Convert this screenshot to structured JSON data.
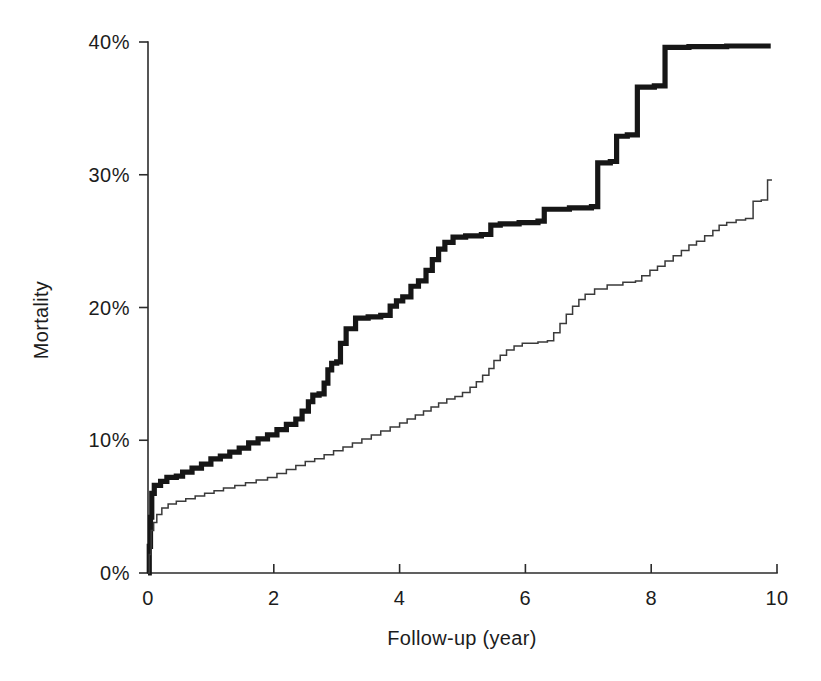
{
  "figure": {
    "background_color": "#ffffff",
    "ink_color": "#1a1a1a"
  },
  "axes": {
    "x_title": "Follow-up (year)",
    "y_title": "Mortality",
    "x_tick_labels": [
      "0",
      "2",
      "4",
      "6",
      "8",
      "10"
    ],
    "y_tick_labels": [
      "0%",
      "10%",
      "20%",
      "30%",
      "40%"
    ]
  },
  "chart_data": {
    "type": "line",
    "subtype": "kaplan-meier-cumulative-step",
    "title": "",
    "subtitle": "",
    "xlabel": "Follow-up (year)",
    "ylabel": "Mortality",
    "xlim": [
      0,
      10
    ],
    "ylim": [
      0,
      40
    ],
    "xticks": [
      0,
      2,
      4,
      6,
      8,
      10
    ],
    "yticks": [
      0,
      10,
      20,
      30,
      40
    ],
    "xtick_labels": [
      "0",
      "2",
      "4",
      "6",
      "8",
      "10"
    ],
    "ytick_labels": [
      "0%",
      "10%",
      "20%",
      "30%",
      "40%"
    ],
    "y_unit": "percent",
    "grid": false,
    "legend": null,
    "legend_position": "none",
    "annotations": [],
    "series": [
      {
        "name": "upper-thick-curve",
        "style": "thick-step",
        "stroke_width_px": 5.2,
        "color": "#161616",
        "final_value": 39.7,
        "points": [
          [
            0.0,
            0.0
          ],
          [
            0.02,
            2.0
          ],
          [
            0.04,
            4.2
          ],
          [
            0.06,
            6.0
          ],
          [
            0.1,
            6.6
          ],
          [
            0.2,
            6.9
          ],
          [
            0.3,
            7.2
          ],
          [
            0.45,
            7.3
          ],
          [
            0.55,
            7.6
          ],
          [
            0.7,
            7.9
          ],
          [
            0.85,
            8.2
          ],
          [
            1.0,
            8.6
          ],
          [
            1.15,
            8.8
          ],
          [
            1.3,
            9.1
          ],
          [
            1.45,
            9.4
          ],
          [
            1.6,
            9.8
          ],
          [
            1.75,
            10.1
          ],
          [
            1.9,
            10.4
          ],
          [
            2.05,
            10.8
          ],
          [
            2.2,
            11.2
          ],
          [
            2.35,
            11.6
          ],
          [
            2.45,
            12.2
          ],
          [
            2.55,
            12.9
          ],
          [
            2.62,
            13.4
          ],
          [
            2.72,
            13.5
          ],
          [
            2.8,
            14.3
          ],
          [
            2.86,
            15.3
          ],
          [
            2.92,
            15.8
          ],
          [
            3.0,
            15.9
          ],
          [
            3.06,
            17.3
          ],
          [
            3.15,
            18.4
          ],
          [
            3.3,
            19.2
          ],
          [
            3.5,
            19.3
          ],
          [
            3.7,
            19.4
          ],
          [
            3.85,
            20.1
          ],
          [
            3.95,
            20.5
          ],
          [
            4.05,
            20.8
          ],
          [
            4.18,
            21.6
          ],
          [
            4.3,
            22.0
          ],
          [
            4.42,
            22.8
          ],
          [
            4.52,
            23.6
          ],
          [
            4.62,
            24.4
          ],
          [
            4.72,
            24.9
          ],
          [
            4.85,
            25.3
          ],
          [
            5.05,
            25.4
          ],
          [
            5.3,
            25.5
          ],
          [
            5.45,
            26.2
          ],
          [
            5.6,
            26.3
          ],
          [
            5.9,
            26.4
          ],
          [
            6.2,
            26.5
          ],
          [
            6.3,
            27.4
          ],
          [
            6.7,
            27.5
          ],
          [
            7.05,
            27.6
          ],
          [
            7.15,
            30.9
          ],
          [
            7.35,
            31.0
          ],
          [
            7.45,
            32.9
          ],
          [
            7.62,
            33.0
          ],
          [
            7.78,
            36.6
          ],
          [
            8.05,
            36.7
          ],
          [
            8.22,
            39.6
          ],
          [
            8.6,
            39.65
          ],
          [
            9.2,
            39.7
          ],
          [
            9.9,
            39.7
          ]
        ]
      },
      {
        "name": "lower-thin-curve",
        "style": "thin-step",
        "stroke_width_px": 1.5,
        "color": "#3a3a3a",
        "final_value": 29.6,
        "points": [
          [
            0.0,
            0.0
          ],
          [
            0.02,
            1.4
          ],
          [
            0.05,
            3.2
          ],
          [
            0.09,
            3.8
          ],
          [
            0.14,
            4.4
          ],
          [
            0.22,
            4.9
          ],
          [
            0.32,
            5.2
          ],
          [
            0.45,
            5.4
          ],
          [
            0.6,
            5.6
          ],
          [
            0.75,
            5.8
          ],
          [
            0.9,
            6.0
          ],
          [
            1.05,
            6.2
          ],
          [
            1.2,
            6.4
          ],
          [
            1.38,
            6.6
          ],
          [
            1.55,
            6.8
          ],
          [
            1.72,
            7.0
          ],
          [
            1.9,
            7.2
          ],
          [
            2.05,
            7.5
          ],
          [
            2.2,
            7.8
          ],
          [
            2.35,
            8.1
          ],
          [
            2.5,
            8.4
          ],
          [
            2.65,
            8.6
          ],
          [
            2.8,
            8.9
          ],
          [
            2.95,
            9.2
          ],
          [
            3.1,
            9.5
          ],
          [
            3.25,
            9.8
          ],
          [
            3.4,
            10.1
          ],
          [
            3.55,
            10.4
          ],
          [
            3.7,
            10.7
          ],
          [
            3.85,
            11.0
          ],
          [
            4.0,
            11.3
          ],
          [
            4.12,
            11.6
          ],
          [
            4.25,
            11.9
          ],
          [
            4.38,
            12.2
          ],
          [
            4.5,
            12.5
          ],
          [
            4.62,
            12.8
          ],
          [
            4.75,
            13.1
          ],
          [
            4.88,
            13.3
          ],
          [
            5.0,
            13.6
          ],
          [
            5.12,
            14.0
          ],
          [
            5.22,
            14.4
          ],
          [
            5.32,
            14.9
          ],
          [
            5.42,
            15.4
          ],
          [
            5.5,
            16.0
          ],
          [
            5.6,
            16.4
          ],
          [
            5.7,
            16.8
          ],
          [
            5.82,
            17.1
          ],
          [
            5.95,
            17.3
          ],
          [
            6.2,
            17.4
          ],
          [
            6.35,
            17.5
          ],
          [
            6.45,
            18.1
          ],
          [
            6.55,
            18.8
          ],
          [
            6.65,
            19.5
          ],
          [
            6.75,
            20.1
          ],
          [
            6.85,
            20.6
          ],
          [
            6.95,
            21.0
          ],
          [
            7.1,
            21.4
          ],
          [
            7.3,
            21.7
          ],
          [
            7.55,
            21.9
          ],
          [
            7.75,
            22.0
          ],
          [
            7.85,
            22.4
          ],
          [
            7.98,
            22.8
          ],
          [
            8.1,
            23.1
          ],
          [
            8.22,
            23.5
          ],
          [
            8.35,
            23.9
          ],
          [
            8.48,
            24.3
          ],
          [
            8.6,
            24.7
          ],
          [
            8.72,
            25.0
          ],
          [
            8.85,
            25.4
          ],
          [
            8.98,
            25.8
          ],
          [
            9.08,
            26.2
          ],
          [
            9.2,
            26.4
          ],
          [
            9.35,
            26.6
          ],
          [
            9.5,
            26.7
          ],
          [
            9.62,
            28.0
          ],
          [
            9.75,
            28.1
          ],
          [
            9.85,
            29.6
          ],
          [
            9.92,
            29.6
          ]
        ]
      }
    ]
  }
}
